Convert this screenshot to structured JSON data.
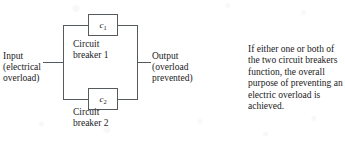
{
  "figure": {
    "kind": "reliability-block-diagram",
    "line_color": "#555a5e",
    "text_color": "#1a1a1a",
    "background_color": "#ffffff"
  },
  "diagram": {
    "input": {
      "label": "Input\n(electrical\noverload)"
    },
    "output": {
      "label": "Output\n(overload\nprevented)"
    },
    "components": [
      {
        "symbol": "c",
        "subscript": "1",
        "caption": "Circuit\nbreaker 1"
      },
      {
        "symbol": "c",
        "subscript": "2",
        "caption": "Circuit\nbreaker 2"
      }
    ]
  },
  "annotation": {
    "text": "If either one or both of the two circuit breakers function, the overall purpose of preventing an electric overload is achieved."
  }
}
